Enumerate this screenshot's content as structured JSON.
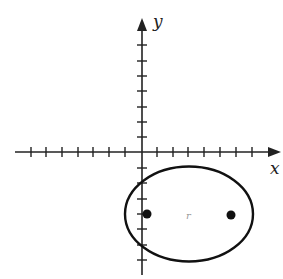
{
  "diagram": {
    "type": "coordinate-plane-ellipse",
    "axes": {
      "x_label": "x",
      "y_label": "y",
      "x_ticks_left": 7,
      "x_ticks_right": 7,
      "y_ticks_above": 7,
      "y_ticks_below": 7,
      "unit": 1
    },
    "ellipse": {
      "center": [
        3,
        -4
      ],
      "semi_major_horizontal": 4,
      "semi_minor_vertical": 3,
      "foci": [
        [
          0.35,
          -4
        ],
        [
          5.65,
          -4
        ]
      ],
      "stroke_color": "#111111"
    },
    "stray_mark": "r",
    "colors": {
      "axis": "#222222",
      "ellipse": "#111111",
      "focus": "#111111",
      "background": "#ffffff"
    }
  }
}
